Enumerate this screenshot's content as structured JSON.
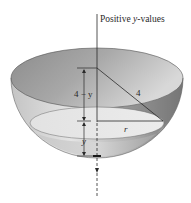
{
  "figure": {
    "type": "hemispherical-bowl-cross-section",
    "axis_label_prefix": "Positive ",
    "axis_label_var": "y",
    "axis_label_suffix": "-values",
    "labels": {
      "top_segment": "4 − y",
      "hypotenuse": "4",
      "radius": "r",
      "height": "y"
    },
    "colors": {
      "rim_inner": "#8a8a8a",
      "bowl_outer_light": "#d8d8d8",
      "bowl_outer_dark": "#7a7a7a",
      "water_surface": "#e6e6e6",
      "line": "#2a2a2a",
      "background": "#ffffff"
    }
  }
}
